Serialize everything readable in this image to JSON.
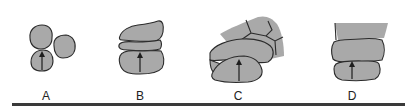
{
  "figure": {
    "colors": {
      "fill": "#a9a9a9",
      "stroke": "#2b2b2b",
      "arrow": "#1e1e1e",
      "rule": "#3a3a3a",
      "background": "#ffffff"
    },
    "panels": [
      {
        "label": "A",
        "description": "three separate rounded grains, arrow in lower-left grain"
      },
      {
        "label": "B",
        "description": "three stacked flattened grains, arrow in bottom grain"
      },
      {
        "label": "C",
        "description": "interlocked cluster of deformed grains, arrow in front grain"
      },
      {
        "label": "D",
        "description": "tightly stacked compacted layers with sutured contacts, arrow in bottom layer"
      }
    ]
  }
}
